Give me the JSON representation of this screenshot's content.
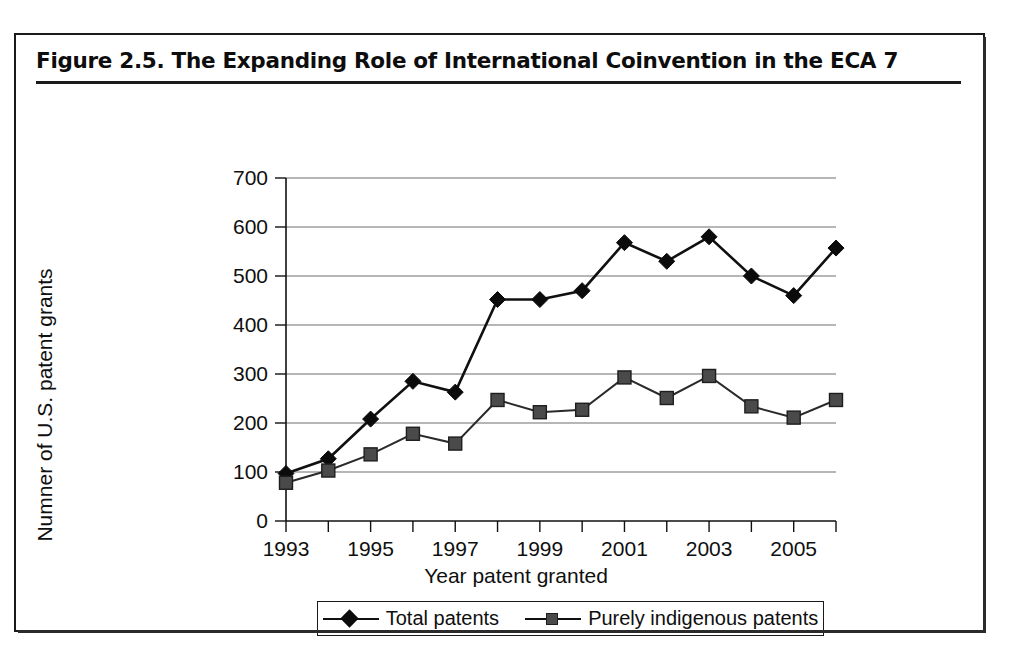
{
  "figure": {
    "title": "Figure 2.5.  The Expanding Role of International Coinvention in the ECA 7"
  },
  "legend": {
    "entries": [
      {
        "label": "Total patents",
        "marker": "diamond-marker-icon"
      },
      {
        "label": "Purely indigenous patents",
        "marker": "square-marker-icon"
      }
    ]
  },
  "chart_data": {
    "type": "line",
    "title": "Figure 2.5.  The Expanding Role of International Coinvention in the ECA 7",
    "xlabel": "Year patent granted",
    "ylabel": "Numner of U.S. patent grants",
    "x": [
      1993,
      1994,
      1995,
      1996,
      1997,
      1998,
      1999,
      2000,
      2001,
      2002,
      2003,
      2004,
      2005,
      2006
    ],
    "x_tick_labels": [
      "1993",
      "",
      "1995",
      "",
      "1997",
      "",
      "1999",
      "",
      "2001",
      "",
      "2003",
      "",
      "2005",
      ""
    ],
    "y_ticks": [
      0,
      100,
      200,
      300,
      400,
      500,
      600,
      700
    ],
    "ylim": [
      0,
      700
    ],
    "xlim": [
      1993,
      2006
    ],
    "grid": "horizontal",
    "legend_position": "bottom",
    "series": [
      {
        "name": "Total patents",
        "marker": "diamond",
        "color": "#0b0b0b",
        "values": [
          97,
          127,
          208,
          285,
          263,
          452,
          452,
          470,
          568,
          530,
          580,
          500,
          460,
          557
        ]
      },
      {
        "name": "Purely indigenous patents",
        "marker": "square",
        "color": "#4a4a4a",
        "values": [
          78,
          103,
          136,
          178,
          158,
          247,
          222,
          227,
          293,
          251,
          296,
          234,
          211,
          247
        ]
      }
    ]
  }
}
